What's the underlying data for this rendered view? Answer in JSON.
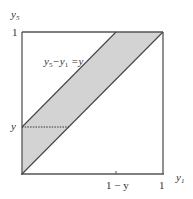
{
  "diagram": {
    "type": "region-plot",
    "axes": {
      "x_label": "y₁",
      "y_label": "y₅",
      "x_ticks": [
        "1 − y",
        "1"
      ],
      "y_ticks": [
        "y",
        "1"
      ]
    },
    "annotation": "y₅−y₁ =y",
    "shaded_region": {
      "description": "band between y5 = y1 and y5 = y1 + y inside the unit square",
      "fill": "#d3d3d3"
    },
    "dotted_line": "horizontal at y5 = y from y5-axis to the line y5 = y1 + y",
    "colors": {
      "axis": "#555555",
      "line": "#444444",
      "fill": "#d3d3d3",
      "text": "#333333"
    }
  },
  "labels": {
    "y5_axis_sub": "5",
    "y5_axis_main": "y",
    "y1_axis_main": "y",
    "y1_axis_sub": "1",
    "tick_y_top": "1",
    "tick_y_mid": "y",
    "tick_x_mid": "1 − y",
    "tick_x_right": "1",
    "eq_y": "y",
    "eq_sub5": "5",
    "eq_minus": "−y",
    "eq_sub1": "1",
    "eq_rhs": " =y"
  }
}
